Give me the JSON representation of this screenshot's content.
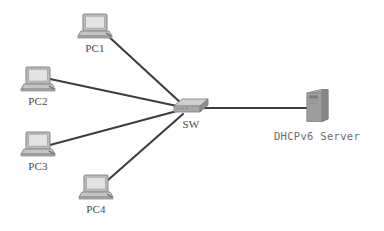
{
  "diagram": {
    "type": "network-topology",
    "background_color": "#ffffff",
    "link_color": "#3d3d3d",
    "device_fill": "#a8a8a8",
    "device_shade": "#8c8c8c",
    "device_light": "#d0d0d0",
    "label_color": "#4a4a4a"
  },
  "nodes": [
    {
      "id": "pc1",
      "label": "PC1",
      "icon": "desktop-computer-icon",
      "x": 95,
      "y": 26,
      "label_x": 95,
      "label_y": 45
    },
    {
      "id": "pc2",
      "label": "PC2",
      "icon": "desktop-computer-icon",
      "x": 38,
      "y": 79,
      "label_x": 34,
      "label_y": 98
    },
    {
      "id": "pc3",
      "label": "PC3",
      "icon": "desktop-computer-icon",
      "x": 38,
      "y": 144,
      "label_x": 34,
      "label_y": 163
    },
    {
      "id": "pc4",
      "label": "PC4",
      "icon": "desktop-computer-icon",
      "x": 96,
      "y": 187,
      "label_x": 95,
      "label_y": 206
    },
    {
      "id": "sw",
      "label": "SW",
      "icon": "switch-icon",
      "x": 190,
      "y": 107,
      "label_x": 191,
      "label_y": 126
    },
    {
      "id": "dhcpv6_server",
      "label": "DHCPv6 Server",
      "icon": "server-tower-icon",
      "x": 318,
      "y": 105,
      "label_x": 317,
      "label_y": 131
    }
  ],
  "links": [
    {
      "id": "pc1-sw",
      "from": "pc1",
      "to": "sw",
      "x1": 107,
      "y1": 35,
      "x2": 182,
      "y2": 104
    },
    {
      "id": "pc2-sw",
      "from": "pc2",
      "to": "sw",
      "x1": 50,
      "y1": 79,
      "x2": 176,
      "y2": 106
    },
    {
      "id": "pc3-sw",
      "from": "pc3",
      "to": "sw",
      "x1": 50,
      "y1": 144,
      "x2": 176,
      "y2": 111
    },
    {
      "id": "pc4-sw",
      "from": "pc4",
      "to": "sw",
      "x1": 108,
      "y1": 180,
      "x2": 182,
      "y2": 114
    },
    {
      "id": "sw-server",
      "from": "sw",
      "to": "dhcpv6_server",
      "x1": 205,
      "y1": 108,
      "x2": 307,
      "y2": 108
    }
  ]
}
